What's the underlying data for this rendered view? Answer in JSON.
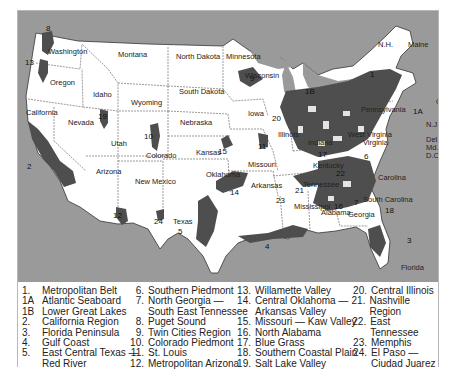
{
  "map": {
    "state_labels": [
      {
        "name": "Washington",
        "x": 30,
        "y": 37
      },
      {
        "name": "Montana",
        "x": 100,
        "y": 40
      },
      {
        "name": "North Dakota",
        "x": 158,
        "y": 42
      },
      {
        "name": "Minnesota",
        "x": 208,
        "y": 42
      },
      {
        "name": "Maine",
        "x": 390,
        "y": 30
      },
      {
        "name": "N.H.",
        "x": 360,
        "y": 30
      },
      {
        "name": "Oregon",
        "x": 32,
        "y": 68
      },
      {
        "name": "Idaho",
        "x": 75,
        "y": 80
      },
      {
        "name": "Wyoming",
        "x": 113,
        "y": 88
      },
      {
        "name": "South Dakota",
        "x": 161,
        "y": 77
      },
      {
        "name": "Wisconsin",
        "x": 227,
        "y": 61
      },
      {
        "name": "Mass.",
        "x": 420,
        "y": 63
      },
      {
        "name": "R.I.",
        "x": 420,
        "y": 79
      },
      {
        "name": "Conn.",
        "x": 418,
        "y": 87
      },
      {
        "name": "Iowa",
        "x": 230,
        "y": 99
      },
      {
        "name": "Nebraska",
        "x": 162,
        "y": 108
      },
      {
        "name": "California",
        "x": 8,
        "y": 98
      },
      {
        "name": "Nevada",
        "x": 50,
        "y": 108
      },
      {
        "name": "Utah",
        "x": 93,
        "y": 129
      },
      {
        "name": "Colorado",
        "x": 128,
        "y": 141
      },
      {
        "name": "Kansas",
        "x": 178,
        "y": 138
      },
      {
        "name": "Missouri",
        "x": 230,
        "y": 150
      },
      {
        "name": "Illinois",
        "x": 260,
        "y": 120
      },
      {
        "name": "Indiana",
        "x": 290,
        "y": 128
      },
      {
        "name": "Kentucky",
        "x": 295,
        "y": 151
      },
      {
        "name": "Virginia",
        "x": 345,
        "y": 128
      },
      {
        "name": "West Virginia",
        "x": 330,
        "y": 120
      },
      {
        "name": "Pennsylvania",
        "x": 343,
        "y": 95
      },
      {
        "name": "N.J.",
        "x": 408,
        "y": 110
      },
      {
        "name": "Del.",
        "x": 408,
        "y": 125
      },
      {
        "name": "Md.",
        "x": 408,
        "y": 133
      },
      {
        "name": "D.C.",
        "x": 408,
        "y": 141
      },
      {
        "name": "Arizona",
        "x": 78,
        "y": 157
      },
      {
        "name": "New Mexico",
        "x": 117,
        "y": 167
      },
      {
        "name": "Oklahoma",
        "x": 188,
        "y": 160
      },
      {
        "name": "Arkansas",
        "x": 233,
        "y": 171
      },
      {
        "name": "Tennessee",
        "x": 285,
        "y": 170
      },
      {
        "name": "Carolina",
        "x": 360,
        "y": 163
      },
      {
        "name": "South Carolina",
        "x": 345,
        "y": 185
      },
      {
        "name": "Mississippi",
        "x": 276,
        "y": 192
      },
      {
        "name": "Alabama",
        "x": 303,
        "y": 198
      },
      {
        "name": "Georgia",
        "x": 330,
        "y": 200
      },
      {
        "name": "Texas",
        "x": 155,
        "y": 207
      },
      {
        "name": "Florida",
        "x": 383,
        "y": 253
      }
    ],
    "region_numbers": [
      {
        "id": "8",
        "x": 28,
        "y": 14
      },
      {
        "id": "13",
        "x": 7,
        "y": 48
      },
      {
        "id": "1",
        "x": 352,
        "y": 60
      },
      {
        "id": "1A",
        "x": 395,
        "y": 97
      },
      {
        "id": "9",
        "x": 232,
        "y": 64
      },
      {
        "id": "1B",
        "x": 287,
        "y": 77
      },
      {
        "id": "20",
        "x": 254,
        "y": 104
      },
      {
        "id": "19",
        "x": 80,
        "y": 102
      },
      {
        "id": "10",
        "x": 126,
        "y": 122
      },
      {
        "id": "2",
        "x": 9,
        "y": 152
      },
      {
        "id": "15",
        "x": 200,
        "y": 137
      },
      {
        "id": "11",
        "x": 240,
        "y": 132
      },
      {
        "id": "17",
        "x": 300,
        "y": 140
      },
      {
        "id": "6",
        "x": 346,
        "y": 142
      },
      {
        "id": "22",
        "x": 318,
        "y": 159
      },
      {
        "id": "21",
        "x": 277,
        "y": 176
      },
      {
        "id": "14",
        "x": 212,
        "y": 178
      },
      {
        "id": "23",
        "x": 258,
        "y": 186
      },
      {
        "id": "16",
        "x": 316,
        "y": 192
      },
      {
        "id": "7",
        "x": 336,
        "y": 188
      },
      {
        "id": "18",
        "x": 367,
        "y": 196
      },
      {
        "id": "12",
        "x": 95,
        "y": 201
      },
      {
        "id": "24",
        "x": 136,
        "y": 207
      },
      {
        "id": "5",
        "x": 160,
        "y": 217
      },
      {
        "id": "4",
        "x": 247,
        "y": 232
      },
      {
        "id": "3",
        "x": 389,
        "y": 226
      }
    ],
    "colors": {
      "water": "#9a9a9a",
      "land": "#ffffff",
      "region": "#4e4e4e",
      "border": "#555555"
    }
  },
  "legend": {
    "columns": [
      [
        {
          "n": "1.",
          "label": "Metropolitan Belt"
        },
        {
          "n": "1A",
          "label": "Atlantic Seaboard"
        },
        {
          "n": "1B",
          "label": "Lower Great Lakes"
        },
        {
          "n": "2.",
          "label": "California Region"
        },
        {
          "n": "3.",
          "label": "Florida Peninsula"
        },
        {
          "n": "4.",
          "label": "Gulf Coast"
        },
        {
          "n": "5.",
          "label": "East Central Texas —"
        },
        {
          "n": "",
          "label": "Red River"
        }
      ],
      [
        {
          "n": "6.",
          "label": "Southern Piedmont"
        },
        {
          "n": "7.",
          "label": "North Georgia —"
        },
        {
          "n": "",
          "label": "South East Tennessee"
        },
        {
          "n": "8.",
          "label": "Puget Sound"
        },
        {
          "n": "9.",
          "label": "Twin Cities Region"
        },
        {
          "n": "10.",
          "label": "Colorado Piedmont"
        },
        {
          "n": "11.",
          "label": "St. Louis"
        },
        {
          "n": "12.",
          "label": "Metropolitan Arizona"
        }
      ],
      [
        {
          "n": "13.",
          "label": "Willamette Valley"
        },
        {
          "n": "14.",
          "label": "Central Oklahoma —"
        },
        {
          "n": "",
          "label": "Arkansas Valley"
        },
        {
          "n": "15.",
          "label": "Missouri — Kaw Valley"
        },
        {
          "n": "16.",
          "label": "North Alabama"
        },
        {
          "n": "17.",
          "label": "Blue Grass"
        },
        {
          "n": "18.",
          "label": "Southern Coastal Plain"
        },
        {
          "n": "19.",
          "label": "Salt Lake Valley"
        }
      ],
      [
        {
          "n": "20.",
          "label": "Central Illinois"
        },
        {
          "n": "21.",
          "label": "Nashville Region"
        },
        {
          "n": "22.",
          "label": "East Tennessee"
        },
        {
          "n": "23.",
          "label": "Memphis"
        },
        {
          "n": "24.",
          "label": "El Paso —"
        },
        {
          "n": "",
          "label": "Ciudad Juarez"
        }
      ]
    ]
  }
}
